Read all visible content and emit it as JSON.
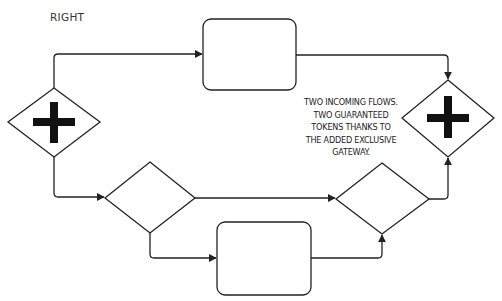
{
  "diagram": {
    "title_label": "RIGHT",
    "annotation": {
      "lines": [
        "TWO INCOMING FLOWS.",
        "TWO GUARANTEED",
        "TOKENS THANKS TO",
        "THE ADDED EXCLUSIVE",
        "GATEWAY."
      ]
    },
    "colors": {
      "stroke": "#222222",
      "fill": "#ffffff",
      "gateway_marker": "#111111",
      "text": "#333333"
    },
    "nodes": [
      {
        "id": "parallel-split",
        "type": "parallel-gateway",
        "marker": "plus"
      },
      {
        "id": "task-top",
        "type": "task",
        "label": ""
      },
      {
        "id": "exclusive-split",
        "type": "exclusive-gateway",
        "marker": "none"
      },
      {
        "id": "task-bottom",
        "type": "task",
        "label": ""
      },
      {
        "id": "exclusive-join",
        "type": "exclusive-gateway",
        "marker": "none"
      },
      {
        "id": "parallel-join",
        "type": "parallel-gateway",
        "marker": "plus"
      }
    ],
    "edges": [
      {
        "from": "parallel-split",
        "to": "task-top"
      },
      {
        "from": "task-top",
        "to": "parallel-join"
      },
      {
        "from": "parallel-split",
        "to": "exclusive-split"
      },
      {
        "from": "exclusive-split",
        "to": "exclusive-join"
      },
      {
        "from": "exclusive-split",
        "to": "task-bottom"
      },
      {
        "from": "task-bottom",
        "to": "exclusive-join"
      },
      {
        "from": "exclusive-join",
        "to": "parallel-join"
      }
    ]
  }
}
